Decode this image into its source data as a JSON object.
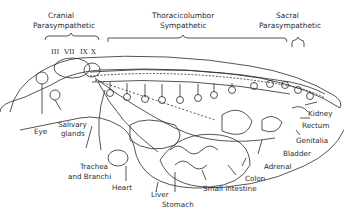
{
  "headers": {
    "cranial": [
      "Cranial",
      "Parasympathetic"
    ],
    "thoracolumbar": [
      "Thoracicolumbor",
      "Sympathetic"
    ],
    "sacral": [
      "Sacral",
      "Parasympathetic"
    ]
  },
  "cranial_nerves": [
    "III",
    "VII",
    "IX",
    "X"
  ],
  "labels": {
    "eye": "Eye",
    "salivary": [
      "Salivary",
      "glands"
    ],
    "trachea": [
      "Trachea",
      "and Branchi"
    ],
    "heart": "Heart",
    "liver": "Liver",
    "stomach": "Stomach",
    "small_intestine": "Small intestine",
    "colon": "Colon",
    "adrenal": "Adrenal",
    "bladder": "Bladder",
    "genitalia": "Genitalia",
    "rectum": "Rectum",
    "kidney": "Kidney"
  },
  "colors": {
    "line": "#2a2a2a",
    "background": "#ffffff"
  }
}
